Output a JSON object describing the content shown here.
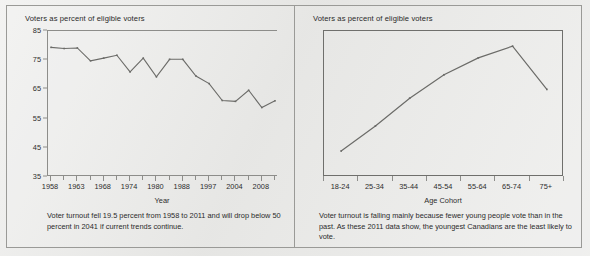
{
  "figure": {
    "panels": [
      {
        "header": "Voters as percent of eligible voters",
        "axis_title": "Year",
        "caption": "Voter turnout fell 19.5 percent from 1958 to 2011 and will drop below 50 percent in 2041 if current trends continue."
      },
      {
        "header": "Voters as percent of eligible voters",
        "axis_title": "Age Cohort",
        "caption": "Voter turnout is falling mainly because fewer young people vote than in the past. As these 2011 data show, the youngest Canadians are the least likely to vote."
      }
    ]
  },
  "colors": {
    "page_background": "#e9e9e7",
    "frame_border": "#9a9a97",
    "axis": "#8d8d8a",
    "plot_box": "#6f6f6c",
    "series_line": "#6b6b68",
    "text": "#2a2a2a"
  },
  "chart_data": [
    {
      "type": "line",
      "title": "Voters as percent of eligible voters",
      "xlabel": "Year",
      "ylabel": "Voters as percent of eligible voters",
      "ylim": [
        35,
        85
      ],
      "yticks": [
        35,
        45,
        55,
        65,
        75,
        85
      ],
      "grid": false,
      "legend": null,
      "x": [
        1958,
        1962,
        1963,
        1965,
        1968,
        1972,
        1974,
        1979,
        1980,
        1984,
        1988,
        1993,
        1997,
        2000,
        2004,
        2006,
        2008,
        2011
      ],
      "xtick_labels": [
        "1958",
        "1963",
        "1968",
        "1974",
        "1980",
        "1988",
        "1997",
        "2004",
        "2008"
      ],
      "values": [
        79.4,
        79.0,
        79.2,
        74.8,
        75.7,
        76.7,
        71.0,
        75.7,
        69.3,
        75.3,
        75.3,
        69.6,
        67.0,
        61.2,
        60.9,
        64.7,
        58.8,
        61.1
      ],
      "series": [
        {
          "name": "Voter turnout",
          "values": [
            79.4,
            79.0,
            79.2,
            74.8,
            75.7,
            76.7,
            71.0,
            75.7,
            69.3,
            75.3,
            75.3,
            69.6,
            67.0,
            61.2,
            60.9,
            64.7,
            58.8,
            61.1
          ]
        }
      ],
      "annotation": "Voter turnout fell 19.5 percent from 1958 to 2011 and will drop below 50 percent in 2041 if current trends continue."
    },
    {
      "type": "line",
      "title": "Voters as percent of eligible voters",
      "xlabel": "Age Cohort",
      "ylabel": "Voters as percent of eligible voters",
      "ylim": [
        35,
        85
      ],
      "grid": false,
      "legend": null,
      "categories": [
        "18-24",
        "25-34",
        "35-44",
        "45-54",
        "55-64",
        "65-74",
        "75+"
      ],
      "values": [
        43.9,
        52.5,
        62.0,
        70.0,
        75.8,
        79.8,
        65.0
      ],
      "series": [
        {
          "name": "Turnout by age cohort, 2011",
          "values": [
            43.9,
            52.5,
            62.0,
            70.0,
            75.8,
            79.8,
            65.0
          ]
        }
      ],
      "annotation": "Voter turnout is falling mainly because fewer young people vote than in the past. As these 2011 data show, the youngest Canadians are the least likely to vote."
    }
  ]
}
